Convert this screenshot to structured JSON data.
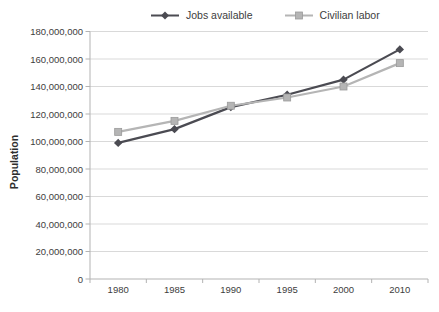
{
  "chart_data": {
    "type": "line",
    "title": "",
    "ylabel": "Population",
    "xlabel": "",
    "categories": [
      "1980",
      "1985",
      "1990",
      "1995",
      "2000",
      "2010"
    ],
    "series": [
      {
        "name": "Jobs available",
        "marker": "diamond",
        "color": "#4b4b52",
        "values": [
          99000000,
          109000000,
          125000000,
          134000000,
          145000000,
          167000000
        ]
      },
      {
        "name": "Civilian labor",
        "marker": "square",
        "color": "#b5b5b5",
        "border": "#9b9b9b",
        "values": [
          107000000,
          115000000,
          126000000,
          132000000,
          140000000,
          157000000
        ]
      }
    ],
    "ylim": [
      0,
      180000000
    ],
    "y_tick_step": 20000000,
    "y_tick_labels": [
      "0",
      "20,000,000",
      "40,000,000",
      "60,000,000",
      "80,000,000",
      "100,000,000",
      "120,000,000",
      "140,000,000",
      "160,000,000",
      "180,000,000"
    ],
    "grid": true,
    "legend_position": "top",
    "colors": {
      "gridline": "#d9d9d9",
      "axis": "#b3b3b3",
      "text": "#3d3d3d"
    }
  }
}
